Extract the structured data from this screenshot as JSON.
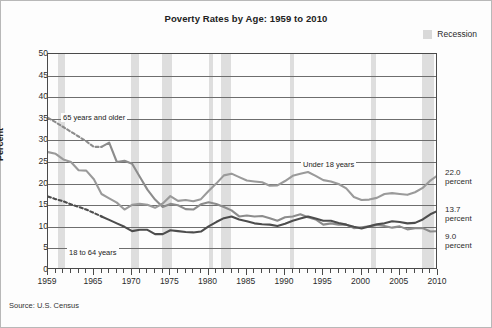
{
  "chart_title": "Poverty Rates by Age: 1959 to 2010",
  "legend": {
    "label": "Recession",
    "swatch_color": "#d9d9d9"
  },
  "source_note": "Source: U.S. Census",
  "axis": {
    "ylabel": "Percent",
    "yticks": [
      "0",
      "5",
      "10",
      "15",
      "20",
      "25",
      "30",
      "35",
      "40",
      "45",
      "50"
    ],
    "xticks": [
      "1959",
      "1965",
      "1970",
      "1975",
      "1980",
      "1985",
      "1990",
      "1995",
      "2000",
      "2005",
      "2010"
    ]
  },
  "annotations": {
    "older": "65 years and older",
    "under18": "Under 18 years",
    "adults": "18 to 64 years"
  },
  "end_labels": {
    "under18_value": "22.0",
    "under18_unit": "percent",
    "adults_value": "13.7",
    "adults_unit": "percent",
    "older_value": "9.0",
    "older_unit": "percent"
  },
  "chart_data": {
    "type": "line",
    "title": "Poverty Rates by Age: 1959 to 2010",
    "xlabel": "",
    "ylabel": "Percent",
    "xlim": [
      1959,
      2010
    ],
    "ylim": [
      0,
      50
    ],
    "grid": true,
    "legend_position": "top-right",
    "x": [
      1959,
      1960,
      1961,
      1962,
      1963,
      1964,
      1965,
      1966,
      1967,
      1968,
      1969,
      1970,
      1971,
      1972,
      1973,
      1974,
      1975,
      1976,
      1977,
      1978,
      1979,
      1980,
      1981,
      1982,
      1983,
      1984,
      1985,
      1986,
      1987,
      1988,
      1989,
      1990,
      1991,
      1992,
      1993,
      1994,
      1995,
      1996,
      1997,
      1998,
      1999,
      2000,
      2001,
      2002,
      2003,
      2004,
      2005,
      2006,
      2007,
      2008,
      2009,
      2010
    ],
    "series": [
      {
        "name": "65 years and older",
        "color": "#8c8c8c",
        "dashed_through": 1966,
        "values": [
          35.2,
          34.2,
          33.1,
          32.0,
          30.9,
          29.8,
          28.5,
          28.5,
          29.5,
          25.0,
          25.3,
          24.6,
          21.6,
          18.6,
          16.3,
          14.6,
          15.3,
          15.0,
          14.1,
          14.0,
          15.2,
          15.7,
          15.3,
          14.6,
          13.8,
          12.4,
          12.6,
          12.4,
          12.5,
          12.0,
          11.4,
          12.2,
          12.4,
          12.9,
          12.2,
          11.7,
          10.5,
          10.8,
          10.5,
          10.5,
          9.7,
          9.9,
          10.1,
          10.4,
          10.2,
          9.8,
          10.1,
          9.4,
          9.7,
          9.7,
          8.9,
          9.0
        ]
      },
      {
        "name": "Under 18 years",
        "color": "#9a9a9a",
        "dashed_through": null,
        "values": [
          27.3,
          26.9,
          25.6,
          25.0,
          23.1,
          23.0,
          21.0,
          17.6,
          16.6,
          15.6,
          14.0,
          15.1,
          15.3,
          15.1,
          14.4,
          15.4,
          17.1,
          16.0,
          16.2,
          15.9,
          16.4,
          18.3,
          20.0,
          21.9,
          22.3,
          21.5,
          20.7,
          20.5,
          20.3,
          19.5,
          19.6,
          20.6,
          21.8,
          22.3,
          22.7,
          21.8,
          20.8,
          20.5,
          19.9,
          18.9,
          16.9,
          16.2,
          16.3,
          16.7,
          17.6,
          17.8,
          17.6,
          17.4,
          18.0,
          19.0,
          20.7,
          22.0
        ]
      },
      {
        "name": "18 to 64 years",
        "color": "#4d4d4d",
        "dashed_through": 1966,
        "values": [
          17.0,
          16.4,
          15.9,
          15.2,
          14.6,
          14.0,
          13.2,
          12.4,
          11.6,
          10.8,
          10.0,
          9.0,
          9.3,
          9.3,
          8.3,
          8.3,
          9.2,
          9.0,
          8.8,
          8.7,
          8.9,
          10.1,
          11.1,
          12.0,
          12.4,
          11.7,
          11.3,
          10.8,
          10.6,
          10.5,
          10.2,
          10.7,
          11.4,
          11.9,
          12.4,
          11.9,
          11.4,
          11.4,
          10.9,
          10.5,
          10.0,
          9.6,
          10.1,
          10.6,
          10.8,
          11.3,
          11.1,
          10.8,
          10.9,
          11.7,
          12.9,
          13.7
        ]
      }
    ],
    "recession_bands": [
      {
        "start": 1960.3,
        "end": 1961.2
      },
      {
        "start": 1969.9,
        "end": 1970.9
      },
      {
        "start": 1973.9,
        "end": 1975.2
      },
      {
        "start": 1980.1,
        "end": 1980.6
      },
      {
        "start": 1981.6,
        "end": 1982.9
      },
      {
        "start": 1990.6,
        "end": 1991.2
      },
      {
        "start": 2001.2,
        "end": 2001.9
      },
      {
        "start": 2007.9,
        "end": 2009.5
      }
    ]
  }
}
